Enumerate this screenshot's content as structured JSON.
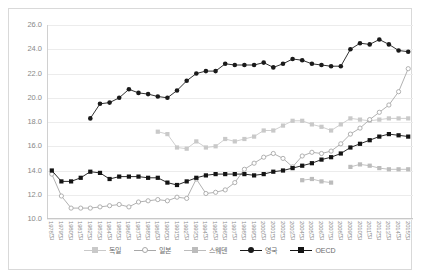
{
  "chart_data": {
    "type": "line",
    "title": "",
    "xlabel": "",
    "ylabel": "",
    "ylim": [
      10.0,
      26.0
    ],
    "ystep": 2.0,
    "grid": true,
    "legend_position": "bottom",
    "ytick_labels": [
      "26.0",
      "24.0",
      "22.0",
      "20.0",
      "18.0",
      "16.0",
      "14.0",
      "12.0",
      "10.0"
    ],
    "categories": [
      "1978년",
      "1979년",
      "1980년",
      "1981년",
      "1982년",
      "1983년",
      "1984년",
      "1985년",
      "1986년",
      "1987년",
      "1988년",
      "1989년",
      "1990년",
      "1991년",
      "1992년",
      "1993년",
      "1994년",
      "1995년",
      "1996년",
      "1997년",
      "1998년",
      "1999년",
      "2000년",
      "2001년",
      "2002년",
      "2003년",
      "2004년",
      "2005년",
      "2006년",
      "2007년",
      "2008년",
      "2009년",
      "2010년",
      "2011년",
      "2012년",
      "2013년",
      "2014년",
      "2015년"
    ],
    "series": [
      {
        "name": "독일",
        "color": "#c9c9c9",
        "marker": "square",
        "filled": true,
        "values": [
          null,
          null,
          null,
          null,
          null,
          null,
          null,
          null,
          null,
          null,
          null,
          17.2,
          17.0,
          15.9,
          15.8,
          16.4,
          15.9,
          16.0,
          16.6,
          16.4,
          16.6,
          16.8,
          17.3,
          17.3,
          17.7,
          18.1,
          18.1,
          17.8,
          17.6,
          17.3,
          17.8,
          18.3,
          18.2,
          18.1,
          18.2,
          18.3,
          18.3,
          18.3
        ]
      },
      {
        "name": "일본",
        "color": "#a8a8a8",
        "marker": "circle-open",
        "filled": false,
        "values": [
          13.7,
          11.9,
          10.9,
          10.9,
          10.9,
          11.0,
          11.1,
          11.2,
          11.0,
          11.4,
          11.5,
          11.6,
          11.5,
          11.8,
          11.7,
          13.3,
          12.1,
          12.2,
          12.4,
          13.0,
          14.1,
          14.6,
          15.1,
          15.4,
          15.0,
          14.3,
          15.2,
          15.5,
          15.4,
          15.6,
          16.2,
          17.0,
          17.5,
          18.2,
          18.8,
          19.4,
          20.5,
          22.4
        ]
      },
      {
        "name": "스웨덴",
        "color": "#bcbcbc",
        "marker": "square",
        "filled": true,
        "values": [
          null,
          null,
          null,
          null,
          null,
          null,
          null,
          null,
          null,
          null,
          null,
          null,
          null,
          null,
          null,
          null,
          null,
          null,
          null,
          null,
          null,
          null,
          null,
          null,
          null,
          null,
          13.2,
          13.3,
          13.1,
          13.0,
          null,
          14.3,
          14.5,
          14.4,
          14.2,
          14.1,
          14.1,
          14.1
        ]
      },
      {
        "name": "영국",
        "color": "#1a1a1a",
        "marker": "circle",
        "filled": true,
        "values": [
          null,
          null,
          null,
          null,
          18.3,
          19.5,
          19.6,
          20.0,
          20.7,
          20.4,
          20.3,
          20.1,
          20.0,
          20.6,
          21.4,
          22.0,
          22.2,
          22.2,
          22.8,
          22.7,
          22.7,
          22.7,
          22.9,
          22.5,
          22.8,
          23.2,
          23.1,
          22.8,
          22.7,
          22.6,
          22.6,
          24.0,
          24.5,
          24.4,
          24.8,
          24.4,
          23.9,
          23.8
        ]
      },
      {
        "name": "OECD",
        "color": "#141414",
        "marker": "square",
        "filled": true,
        "values": [
          14.0,
          13.1,
          13.1,
          13.4,
          13.9,
          13.8,
          13.3,
          13.5,
          13.5,
          13.5,
          13.4,
          13.4,
          13.0,
          12.8,
          13.1,
          13.4,
          13.6,
          13.7,
          13.7,
          13.7,
          13.7,
          13.6,
          13.7,
          13.9,
          14.0,
          14.2,
          14.4,
          14.6,
          14.9,
          15.1,
          15.4,
          15.9,
          16.2,
          16.5,
          16.8,
          17.0,
          16.9,
          16.8
        ]
      }
    ]
  },
  "legend": {
    "items": [
      {
        "label": "독일"
      },
      {
        "label": "일본"
      },
      {
        "label": "스웨덴"
      },
      {
        "label": "영국"
      },
      {
        "label": "OECD"
      }
    ]
  }
}
